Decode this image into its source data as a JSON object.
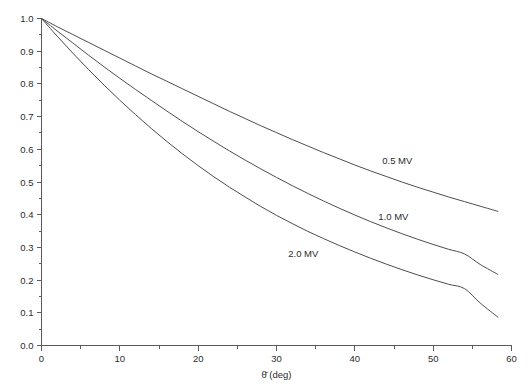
{
  "chart_data": {
    "type": "line",
    "title": "",
    "subtitle": "",
    "xlabel": "θ̄ (deg)",
    "ylabel": "",
    "xlim": [
      0,
      60
    ],
    "ylim": [
      0.0,
      1.0
    ],
    "grid": false,
    "legend_position": "inline-annotations",
    "x_ticks": [
      0,
      10,
      20,
      30,
      40,
      50,
      60
    ],
    "x_tick_labels": [
      "0",
      "10",
      "20",
      "30",
      "40",
      "50",
      "60"
    ],
    "x_minor_ticks": [
      5,
      15,
      25,
      35,
      45,
      55
    ],
    "y_ticks": [
      0.0,
      0.1,
      0.2,
      0.3,
      0.4,
      0.5,
      0.6,
      0.7,
      0.8,
      0.9,
      1.0
    ],
    "y_tick_labels": [
      "0.0",
      "0.1",
      "0.2",
      "0.3",
      "0.4",
      "0.5",
      "0.6",
      "0.7",
      "0.8",
      "0.9",
      "1.0"
    ],
    "y_minor_ticks": [
      0.05,
      0.15,
      0.25,
      0.35,
      0.45,
      0.55,
      0.65,
      0.75,
      0.85,
      0.95
    ],
    "x": [
      0,
      2,
      4,
      6,
      8,
      10,
      12,
      14,
      16,
      18,
      20,
      22,
      24,
      26,
      28,
      30,
      32,
      34,
      36,
      38,
      40,
      42,
      44,
      46,
      48,
      50,
      52,
      54,
      56,
      58.3
    ],
    "series": [
      {
        "name": "0.5 MV",
        "label": "0.5 MV",
        "color": "#4d4d4d",
        "label_x": 43.5,
        "label_y": 0.556,
        "values": [
          1.0,
          0.975,
          0.951,
          0.927,
          0.903,
          0.879,
          0.855,
          0.831,
          0.808,
          0.785,
          0.762,
          0.739,
          0.716,
          0.694,
          0.672,
          0.651,
          0.63,
          0.61,
          0.59,
          0.571,
          0.552,
          0.534,
          0.517,
          0.5,
          0.484,
          0.469,
          0.454,
          0.44,
          0.426,
          0.41
        ]
      },
      {
        "name": "1.0 MV",
        "label": "1.0 MV",
        "color": "#4d4d4d",
        "label_x": 43.0,
        "label_y": 0.385,
        "values": [
          1.0,
          0.962,
          0.925,
          0.888,
          0.852,
          0.817,
          0.783,
          0.75,
          0.717,
          0.685,
          0.654,
          0.624,
          0.595,
          0.567,
          0.54,
          0.514,
          0.489,
          0.465,
          0.442,
          0.42,
          0.399,
          0.379,
          0.36,
          0.342,
          0.325,
          0.309,
          0.294,
          0.28,
          0.248,
          0.217
        ]
      },
      {
        "name": "2.0 MV",
        "label": "2.0 MV",
        "color": "#4d4d4d",
        "label_x": 31.5,
        "label_y": 0.272,
        "values": [
          1.0,
          0.946,
          0.894,
          0.844,
          0.796,
          0.75,
          0.706,
          0.664,
          0.624,
          0.586,
          0.55,
          0.516,
          0.484,
          0.454,
          0.425,
          0.398,
          0.373,
          0.349,
          0.327,
          0.306,
          0.286,
          0.267,
          0.249,
          0.232,
          0.216,
          0.201,
          0.187,
          0.174,
          0.13,
          0.086
        ]
      }
    ]
  },
  "axis": {
    "x_axis_name": "x-axis",
    "y_axis_name": "y-axis"
  }
}
